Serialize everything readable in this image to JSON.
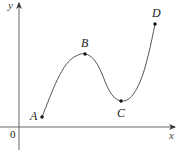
{
  "figure": {
    "axes": {
      "x_label": "x",
      "y_label": "y",
      "origin_label": "0"
    },
    "points": [
      {
        "label": "A",
        "x": 42,
        "y": 117
      },
      {
        "label": "B",
        "x": 85,
        "y": 54
      },
      {
        "label": "C",
        "x": 121,
        "y": 101
      },
      {
        "label": "D",
        "x": 155,
        "y": 24
      }
    ],
    "colors": {
      "axis": "#555555",
      "curve": "#555555",
      "point": "#111111"
    }
  }
}
